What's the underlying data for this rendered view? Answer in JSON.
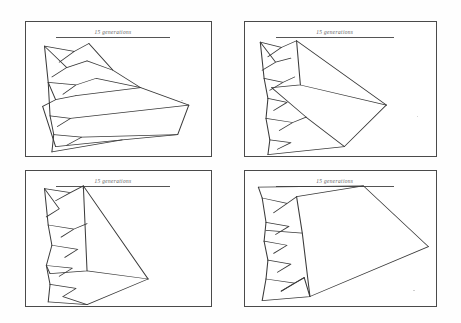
{
  "figure": {
    "background_color": "#ffffff",
    "ink_color": "#3a3a3a",
    "border_color": "#4a4a4a",
    "layout": "2x2 grid of framed tree diagrams",
    "panel_count": 4
  },
  "panels": [
    {
      "id": "panel-top-left",
      "title": "15 generations",
      "position": "top-left"
    },
    {
      "id": "panel-top-right",
      "title": "15 generations",
      "position": "top-right"
    },
    {
      "id": "panel-bottom-left",
      "title": "15 generations",
      "position": "bottom-left"
    },
    {
      "id": "panel-bottom-right",
      "title": "15 generations",
      "position": "bottom-right"
    }
  ],
  "chart_data": {
    "type": "line",
    "title": "",
    "subtitle": "",
    "xlabel": "",
    "ylabel": "",
    "grid": false,
    "legend": "none",
    "series": [
      {
        "name": "panel-top-left-tree",
        "polylines": [
          [
            [
              10,
              18
            ],
            [
              26,
              22
            ],
            [
              18,
              30
            ],
            [
              26,
              22
            ],
            [
              34,
              16
            ]
          ],
          [
            [
              10,
              18
            ],
            [
              22,
              34
            ],
            [
              14,
              41
            ],
            [
              22,
              34
            ],
            [
              33,
              29
            ]
          ],
          [
            [
              10,
              18
            ],
            [
              12,
              45
            ]
          ],
          [
            [
              12,
              45
            ],
            [
              27,
              47
            ],
            [
              20,
              54
            ],
            [
              27,
              47
            ],
            [
              38,
              42
            ]
          ],
          [
            [
              12,
              45
            ],
            [
              16,
              58
            ],
            [
              9,
              63
            ],
            [
              16,
              58
            ],
            [
              27,
              55
            ]
          ],
          [
            [
              12,
              45
            ],
            [
              13,
              70
            ]
          ],
          [
            [
              13,
              70
            ],
            [
              24,
              72
            ],
            [
              17,
              78
            ]
          ],
          [
            [
              13,
              70
            ],
            [
              15,
              84
            ]
          ],
          [
            [
              15,
              84
            ],
            [
              30,
              86
            ],
            [
              22,
              92
            ]
          ],
          [
            [
              15,
              84
            ],
            [
              14,
              97
            ]
          ],
          [
            [
              34,
              16
            ],
            [
              47,
              36
            ],
            [
              62,
              49
            ],
            [
              88,
              62
            ]
          ],
          [
            [
              33,
              29
            ],
            [
              47,
              36
            ]
          ],
          [
            [
              38,
              42
            ],
            [
              62,
              49
            ]
          ],
          [
            [
              27,
              55
            ],
            [
              62,
              49
            ]
          ],
          [
            [
              24,
              72
            ],
            [
              88,
              62
            ]
          ],
          [
            [
              88,
              62
            ],
            [
              82,
              84
            ],
            [
              52,
              88
            ],
            [
              16,
              93
            ]
          ],
          [
            [
              82,
              84
            ],
            [
              30,
              86
            ]
          ],
          [
            [
              14,
              97
            ],
            [
              52,
              88
            ]
          ],
          [
            [
              9,
              63
            ],
            [
              16,
              93
            ]
          ]
        ]
      },
      {
        "name": "panel-top-right-tree",
        "polylines": [
          [
            [
              8,
              15
            ],
            [
              19,
              19
            ],
            [
              12,
              26
            ],
            [
              19,
              19
            ],
            [
              27,
              14
            ]
          ],
          [
            [
              8,
              15
            ],
            [
              16,
              30
            ],
            [
              9,
              36
            ],
            [
              16,
              30
            ],
            [
              24,
              27
            ]
          ],
          [
            [
              8,
              15
            ],
            [
              10,
              42
            ]
          ],
          [
            [
              10,
              42
            ],
            [
              20,
              45
            ],
            [
              13,
              51
            ],
            [
              20,
              45
            ],
            [
              26,
              41
            ]
          ],
          [
            [
              10,
              42
            ],
            [
              12,
              57
            ]
          ],
          [
            [
              12,
              57
            ],
            [
              22,
              60
            ],
            [
              15,
              66
            ]
          ],
          [
            [
              12,
              57
            ],
            [
              11,
              72
            ]
          ],
          [
            [
              11,
              72
            ],
            [
              25,
              75
            ],
            [
              18,
              81
            ],
            [
              25,
              75
            ],
            [
              32,
              71
            ]
          ],
          [
            [
              11,
              72
            ],
            [
              13,
              88
            ]
          ],
          [
            [
              13,
              88
            ],
            [
              24,
              90
            ],
            [
              17,
              95
            ]
          ],
          [
            [
              13,
              88
            ],
            [
              12,
              99
            ]
          ],
          [
            [
              27,
              14
            ],
            [
              29,
              47
            ],
            [
              14,
              49
            ]
          ],
          [
            [
              27,
              14
            ],
            [
              74,
              62
            ]
          ],
          [
            [
              74,
              62
            ],
            [
              29,
              47
            ]
          ],
          [
            [
              74,
              62
            ],
            [
              52,
              93
            ]
          ],
          [
            [
              52,
              93
            ],
            [
              32,
              71
            ]
          ],
          [
            [
              52,
              93
            ],
            [
              12,
              99
            ]
          ],
          [
            [
              32,
              71
            ],
            [
              14,
              49
            ]
          ]
        ]
      },
      {
        "name": "panel-bottom-left-tree",
        "polylines": [
          [
            [
              10,
              13
            ],
            [
              24,
              16
            ],
            [
              16,
              22
            ],
            [
              24,
              16
            ],
            [
              31,
              11
            ]
          ],
          [
            [
              10,
              13
            ],
            [
              18,
              28
            ],
            [
              11,
              34
            ]
          ],
          [
            [
              10,
              13
            ],
            [
              12,
              40
            ]
          ],
          [
            [
              12,
              40
            ],
            [
              26,
              43
            ],
            [
              19,
              49
            ],
            [
              26,
              43
            ],
            [
              33,
              39
            ]
          ],
          [
            [
              12,
              40
            ],
            [
              14,
              55
            ]
          ],
          [
            [
              14,
              55
            ],
            [
              28,
              58
            ],
            [
              21,
              64
            ]
          ],
          [
            [
              14,
              55
            ],
            [
              11,
              70
            ]
          ],
          [
            [
              11,
              70
            ],
            [
              25,
              72
            ],
            [
              18,
              78
            ]
          ],
          [
            [
              11,
              70
            ],
            [
              13,
              84
            ]
          ],
          [
            [
              13,
              84
            ],
            [
              27,
              87
            ],
            [
              20,
              93
            ]
          ],
          [
            [
              13,
              84
            ],
            [
              12,
              97
            ]
          ],
          [
            [
              31,
              11
            ],
            [
              33,
              74
            ],
            [
              13,
              76
            ]
          ],
          [
            [
              31,
              11
            ],
            [
              66,
              80
            ]
          ],
          [
            [
              66,
              80
            ],
            [
              33,
              74
            ]
          ],
          [
            [
              66,
              80
            ],
            [
              33,
              99
            ]
          ],
          [
            [
              33,
              99
            ],
            [
              12,
              97
            ]
          ],
          [
            [
              33,
              99
            ],
            [
              20,
              93
            ]
          ],
          [
            [
              13,
              76
            ],
            [
              11,
              70
            ]
          ]
        ]
      },
      {
        "name": "panel-bottom-right-tree",
        "polylines": [
          [
            [
              7,
              12
            ],
            [
              62,
              11
            ],
            [
              96,
              56
            ]
          ],
          [
            [
              7,
              12
            ],
            [
              9,
              20
            ]
          ],
          [
            [
              9,
              20
            ],
            [
              22,
              24
            ],
            [
              15,
              31
            ],
            [
              22,
              24
            ],
            [
              27,
              19
            ]
          ],
          [
            [
              9,
              20
            ],
            [
              11,
              38
            ]
          ],
          [
            [
              11,
              38
            ],
            [
              23,
              41
            ],
            [
              16,
              47
            ]
          ],
          [
            [
              11,
              38
            ],
            [
              10,
              52
            ]
          ],
          [
            [
              10,
              52
            ],
            [
              22,
              55
            ],
            [
              15,
              61
            ]
          ],
          [
            [
              10,
              52
            ],
            [
              12,
              66
            ]
          ],
          [
            [
              12,
              66
            ],
            [
              24,
              69
            ],
            [
              17,
              75
            ]
          ],
          [
            [
              12,
              66
            ],
            [
              11,
              80
            ]
          ],
          [
            [
              11,
              80
            ],
            [
              26,
              83
            ],
            [
              19,
              89
            ],
            [
              26,
              83
            ],
            [
              31,
              79
            ]
          ],
          [
            [
              11,
              80
            ],
            [
              9,
              96
            ]
          ],
          [
            [
              27,
              19
            ],
            [
              30,
              46
            ],
            [
              11,
              44
            ]
          ],
          [
            [
              27,
              19
            ],
            [
              62,
              11
            ]
          ],
          [
            [
              96,
              56
            ],
            [
              34,
              93
            ],
            [
              9,
              96
            ]
          ],
          [
            [
              30,
              46
            ],
            [
              34,
              93
            ]
          ],
          [
            [
              31,
              79
            ],
            [
              34,
              93
            ]
          ],
          [
            [
              31,
              79
            ],
            [
              19,
              89
            ]
          ]
        ]
      }
    ]
  }
}
